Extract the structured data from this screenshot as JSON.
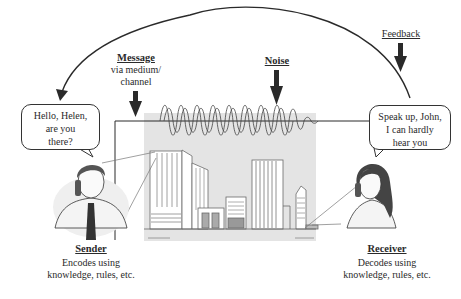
{
  "diagram": {
    "type": "communication-process-model",
    "labels": {
      "message": {
        "title": "Message",
        "sub1": "via medium/",
        "sub2": "channel"
      },
      "noise": {
        "title": "Noise"
      },
      "feedback": {
        "title": "Feedback"
      },
      "sender": {
        "title": "Sender",
        "sub1": "Encodes using",
        "sub2": "knowledge, rules, etc."
      },
      "receiver": {
        "title": "Receiver",
        "sub1": "Decodes using",
        "sub2": "knowledge, rules, etc."
      }
    },
    "bubbles": {
      "sender": {
        "line1": "Hello, Helen,",
        "line2": "are you",
        "line3": "there?"
      },
      "receiver": {
        "line1": "Speak up, John,",
        "line2": "I can hardly",
        "line3": "hear you"
      }
    },
    "colors": {
      "line": "#2a2a2a",
      "channel_bg": "#e2e2e2",
      "building": "#ffffff",
      "building_stroke": "#6a6a6a",
      "building_fill_dark": "#a8a8a8"
    }
  }
}
